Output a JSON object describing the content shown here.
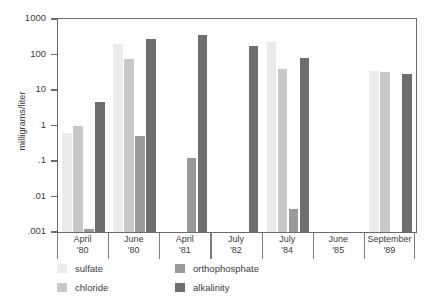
{
  "chart_data": {
    "type": "bar",
    "title": "",
    "subtitle": "",
    "xlabel": "",
    "ylabel": "milligrams/liter",
    "yscale": "log",
    "ylim": [
      0.001,
      1000
    ],
    "ytick_labels": [
      "1000",
      "100",
      "10",
      "1",
      ".1",
      ".01",
      ".001"
    ],
    "ytick_values": [
      1000,
      100,
      10,
      1,
      0.1,
      0.01,
      0.001
    ],
    "grid": false,
    "legend_position": "bottom-left",
    "categories": [
      {
        "line1": "April",
        "line2": "'80"
      },
      {
        "line1": "June",
        "line2": "'80"
      },
      {
        "line1": "April",
        "line2": "'81"
      },
      {
        "line1": "July",
        "line2": "'82"
      },
      {
        "line1": "July",
        "line2": "'84"
      },
      {
        "line1": "June",
        "line2": "'85"
      },
      {
        "line1": "September",
        "line2": "'89"
      }
    ],
    "series": [
      {
        "name": "sulfate",
        "color": "#ebebeb",
        "values": [
          0.6,
          200,
          null,
          null,
          230,
          null,
          35
        ]
      },
      {
        "name": "chloride",
        "color": "#c8c8c8",
        "values": [
          1.0,
          75,
          null,
          null,
          40,
          null,
          32
        ]
      },
      {
        "name": "orthophosphate",
        "color": "#9a9a9a",
        "values": [
          0.0012,
          0.5,
          0.12,
          null,
          0.0045,
          null,
          null
        ]
      },
      {
        "name": "alkalinity",
        "color": "#6e6e6e",
        "values": [
          4.5,
          270,
          350,
          170,
          80,
          null,
          28
        ]
      }
    ]
  },
  "axis": {
    "y_title": "milligrams/liter"
  }
}
